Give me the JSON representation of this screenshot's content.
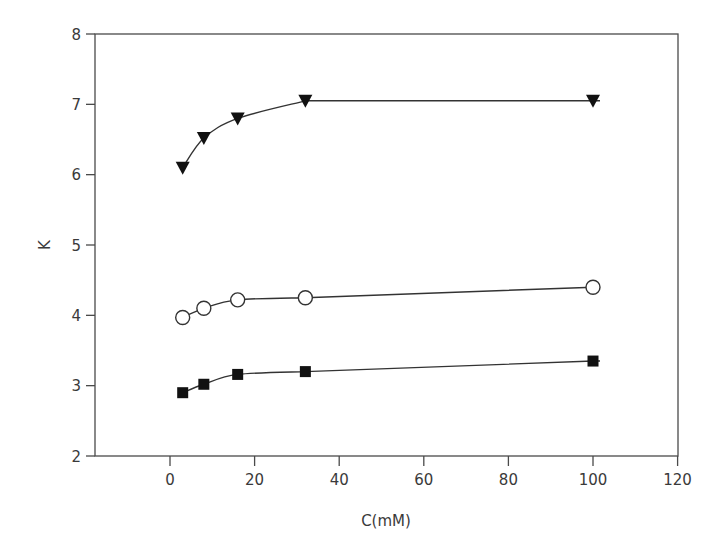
{
  "chart_data": {
    "type": "line",
    "title": "",
    "xlabel": "C(mM)",
    "ylabel": "K",
    "xlim": [
      -20,
      120
    ],
    "ylim": [
      2,
      8
    ],
    "x_ticks": [
      0,
      20,
      40,
      60,
      80,
      100,
      120
    ],
    "y_ticks": [
      2,
      3,
      4,
      5,
      6,
      7,
      8
    ],
    "grid": false,
    "legend": null,
    "series": [
      {
        "name": "filled triangles",
        "marker": "triangle-down-filled",
        "color": "#111111",
        "x": [
          3,
          8,
          16,
          32,
          100
        ],
        "values": [
          6.1,
          6.52,
          6.8,
          7.05,
          7.05
        ]
      },
      {
        "name": "open circles",
        "marker": "circle-open",
        "color": "#111111",
        "x": [
          3,
          8,
          16,
          32,
          100
        ],
        "values": [
          3.97,
          4.1,
          4.22,
          4.25,
          4.4
        ]
      },
      {
        "name": "filled squares",
        "marker": "square-filled",
        "color": "#111111",
        "x": [
          3,
          8,
          16,
          32,
          100
        ],
        "values": [
          2.9,
          3.02,
          3.16,
          3.2,
          3.35
        ]
      }
    ]
  }
}
